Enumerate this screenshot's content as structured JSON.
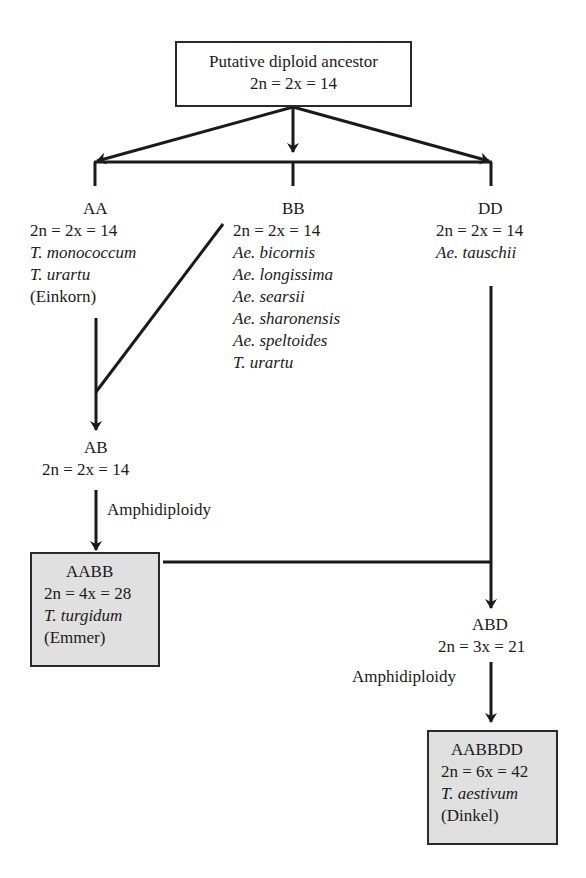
{
  "diagram": {
    "colors": {
      "line": "#1a1a1a",
      "box_border": "#2a2a2a",
      "shaded_fill": "#e0e0e0"
    },
    "ancestor": {
      "title": "Putative diploid ancestor",
      "chromosomes": "2n = 2x = 14"
    },
    "aa": {
      "genome": "AA",
      "chromosomes": "2n = 2x = 14",
      "species": [
        "T. monococcum",
        "T. urartu"
      ],
      "common": "(Einkorn)"
    },
    "bb": {
      "genome": "BB",
      "chromosomes": "2n = 2x = 14",
      "species": [
        "Ae. bicornis",
        "Ae. longissima",
        "Ae. searsii",
        "Ae. sharonensis",
        "Ae. speltoides",
        "T. urartu"
      ]
    },
    "dd": {
      "genome": "DD",
      "chromosomes": "2n = 2x = 14",
      "species": [
        "Ae. tauschii"
      ]
    },
    "ab": {
      "genome": "AB",
      "chromosomes": "2n = 2x = 14"
    },
    "amphidiploidy_1": "Amphidiploidy",
    "aabb": {
      "genome": "AABB",
      "chromosomes": "2n = 4x = 28",
      "species": "T. turgidum",
      "common": "(Emmer)"
    },
    "abd": {
      "genome": "ABD",
      "chromosomes": "2n = 3x = 21"
    },
    "amphidiploidy_2": "Amphidiploidy",
    "aabbdd": {
      "genome": "AABBDD",
      "chromosomes": "2n = 6x = 42",
      "species": "T. aestivum",
      "common": "(Dinkel)"
    }
  }
}
